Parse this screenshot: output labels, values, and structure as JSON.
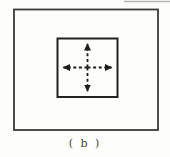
{
  "figure": {
    "caption": "( b )"
  },
  "colors": {
    "outer_line": "#3a3a38",
    "inner_line": "#222220",
    "arrow_line": "#1c1c1a",
    "artifact_line": "#b8b8b2",
    "caption_text": "#45453c",
    "background": "#fdfdfc"
  }
}
